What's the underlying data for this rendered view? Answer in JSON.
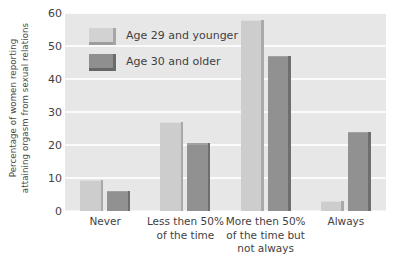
{
  "chart_data": {
    "type": "bar",
    "title": "",
    "subtitle": "",
    "xlabel": "",
    "ylabel_lines": [
      "Percentage of women reporting",
      "attaining orgasm from sexual relations"
    ],
    "ylabel": "Percentage of women reporting attaining orgasm from sexual relations",
    "categories": [
      [
        "Never"
      ],
      [
        "Less then 50%",
        "of the time"
      ],
      [
        "More then 50%",
        "of the time but",
        "not always"
      ],
      [
        "Always"
      ]
    ],
    "series": [
      {
        "name": "Age 29 and younger",
        "color": "#cdcdcd",
        "values": [
          9.5,
          27,
          58,
          3
        ]
      },
      {
        "name": "Age 30 and older",
        "color": "#919191",
        "values": [
          6,
          20.5,
          47,
          24
        ]
      }
    ],
    "ylim": [
      0,
      60
    ],
    "yticks": [
      0,
      10,
      20,
      30,
      40,
      50,
      60
    ],
    "ytick_labels": [
      "0",
      "10",
      "20",
      "30",
      "40",
      "50",
      "60"
    ],
    "grid": true,
    "grid_axis": "y",
    "legend_position": "upper-left-inside",
    "plot_background": "#e7e7e7",
    "gridline_color": "#fbfbfb",
    "figure_background": "#ffffff"
  },
  "legend": {
    "entries": [
      {
        "label": "Age 29 and younger",
        "swatch": "light"
      },
      {
        "label": "Age 30 and older",
        "swatch": "dark"
      }
    ]
  }
}
